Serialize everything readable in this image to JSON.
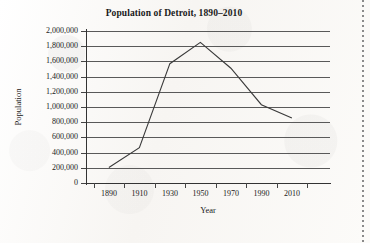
{
  "chart_data": {
    "type": "line",
    "title": "Population of Detroit, 1890–2010",
    "xlabel": "Year",
    "ylabel": "Population",
    "x": [
      1890,
      1910,
      1930,
      1950,
      1970,
      1990,
      2010
    ],
    "values": [
      205000,
      465000,
      1570000,
      1850000,
      1510000,
      1030000,
      855000
    ],
    "series": [
      {
        "name": "Population of Detroit",
        "values": [
          205000,
          465000,
          1570000,
          1850000,
          1510000,
          1030000,
          855000
        ]
      }
    ],
    "categories": [
      "1890",
      "1910",
      "1930",
      "1950",
      "1970",
      "1990",
      "2010"
    ],
    "xlim": [
      1880,
      2020
    ],
    "ylim": [
      0,
      2000000
    ],
    "y_ticks": [
      0,
      200000,
      400000,
      600000,
      800000,
      1000000,
      1200000,
      1400000,
      1600000,
      1800000,
      2000000
    ],
    "y_tick_labels": [
      "2,000,000",
      "1,800,000",
      "1,600,000",
      "1,400,000",
      "1,200,000",
      "1,000,000",
      "800,000",
      "600,000",
      "400,000",
      "200,000",
      "0"
    ],
    "x_tick_labels": [
      "1890",
      "1910",
      "1930",
      "1950",
      "1970",
      "1990",
      "2010"
    ],
    "grid": "horizontal",
    "legend": "none",
    "line_color": "#3a3a3a",
    "grid_color": "#595959",
    "axis_color": "#333333",
    "background_color": "#fbfaf8"
  }
}
